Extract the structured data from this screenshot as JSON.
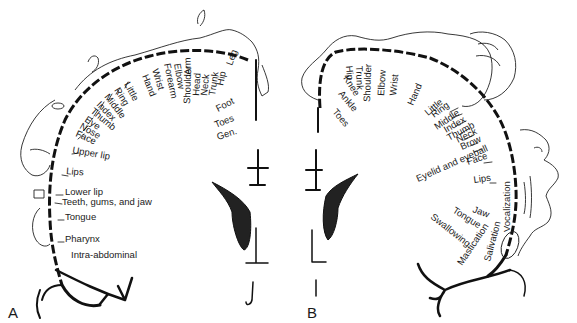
{
  "figure": {
    "panel_a": {
      "label": "A",
      "title": "Sensory homunculus",
      "labels": [
        "Leg",
        "Hip",
        "Trunk",
        "Neck",
        "Head",
        "Shoulder",
        "Arm",
        "Elbow",
        "Forearm",
        "Wrist",
        "Hand",
        "Little",
        "Ring",
        "Middle",
        "Index",
        "Thumb",
        "Eye",
        "Nose",
        "Face",
        "Upper lip",
        "Lips",
        "Lower lip",
        "Teeth, gums, and jaw",
        "Tongue",
        "Pharynx",
        "Intra-abdominal",
        "Foot",
        "Toes",
        "Gen."
      ]
    },
    "panel_b": {
      "label": "B",
      "title": "Motor homunculus",
      "labels": [
        "Toes",
        "Ankle",
        "Knee",
        "Hip",
        "Trunk",
        "Shoulder",
        "Elbow",
        "Wrist",
        "Hand",
        "Little",
        "Ring",
        "Middle",
        "Index",
        "Thumb",
        "Neck",
        "Brow",
        "Eyelid and eyeball",
        "Face",
        "Lips",
        "Vocalization",
        "Jaw",
        "Tongue",
        "Swallowing",
        "Mastication",
        "Salivation"
      ]
    }
  },
  "colors": {
    "ink": "#111111",
    "background": "#ffffff"
  }
}
